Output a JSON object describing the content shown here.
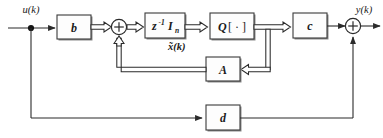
{
  "diagram": {
    "background_color": "#ffffff",
    "line_color": "#2b2b2b",
    "box_fill": "#fdfdfd",
    "signals": {
      "input": "u(k)",
      "output": "y(k)",
      "state": "x̃(k)"
    },
    "blocks": [
      {
        "id": "b",
        "label": "b",
        "name": "input-gain-block"
      },
      {
        "id": "delay",
        "label": "z",
        "exponent": "-1",
        "matrix": "I",
        "subscript": "n",
        "name": "unit-delay-block"
      },
      {
        "id": "q",
        "label": "Q",
        "bracket": "[ · ]",
        "name": "quantizer-block"
      },
      {
        "id": "c",
        "label": "c",
        "name": "output-gain-block"
      },
      {
        "id": "a",
        "label": "A",
        "name": "state-matrix-block"
      },
      {
        "id": "d",
        "label": "d",
        "name": "feedthrough-block"
      }
    ],
    "junctions": [
      {
        "id": "sum-left",
        "symbol": "+",
        "name": "left-summing-junction"
      },
      {
        "id": "sum-right",
        "symbol": "+",
        "name": "right-summing-junction"
      },
      {
        "id": "input-node",
        "symbol": "•",
        "name": "input-branch-node"
      }
    ]
  }
}
